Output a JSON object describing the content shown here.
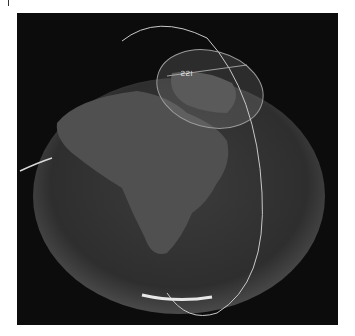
{
  "image": {
    "description": "Rendered globe view of Earth (Europe/Africa) with satellite orbit track and coverage footprint",
    "satellite_label": "ISS",
    "colors": {
      "background": "#0c0c0c",
      "globe": "#3a3a3a",
      "land": "#555555",
      "orbit": "#c8c8c8",
      "footprint": "#8a8a8a"
    }
  }
}
